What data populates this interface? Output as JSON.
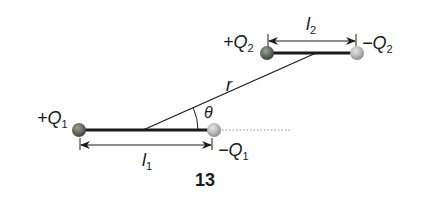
{
  "figure": {
    "number": "13",
    "dipole1": {
      "positive_label": "+Q",
      "positive_sub": "1",
      "negative_label": "−Q",
      "negative_sub": "1",
      "length_label": "l",
      "length_sub": "1"
    },
    "dipole2": {
      "positive_label": "+Q",
      "positive_sub": "2",
      "negative_label": "−Q",
      "negative_sub": "2",
      "length_label": "l",
      "length_sub": "2"
    },
    "separation_label": "r",
    "angle_label": "θ",
    "colors": {
      "positive_charge": "#5f6a5c",
      "negative_charge": "#b8b8b8",
      "line": "#1a1a1a",
      "dotted": "#888888"
    }
  }
}
